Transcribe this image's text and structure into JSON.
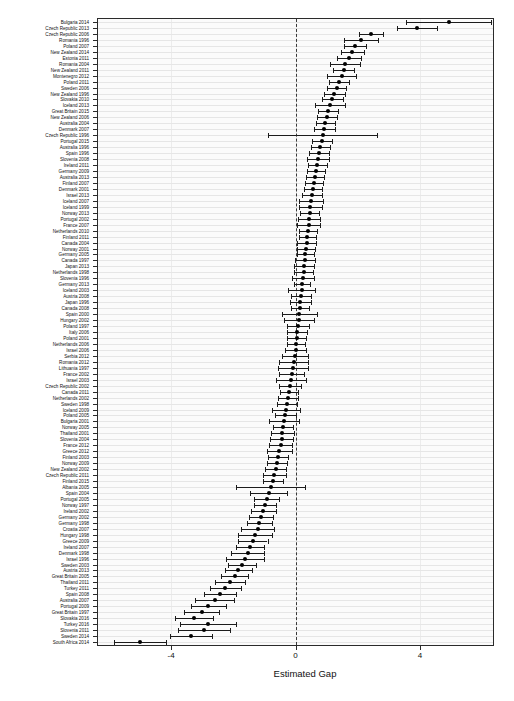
{
  "chart": {
    "type": "forest",
    "xlabel": "Estimated Gap",
    "ylabel": "",
    "title": "",
    "xlim": [
      -6.35,
      6.35
    ],
    "xticks": [
      -4,
      0,
      4
    ],
    "xticklabels": [
      "-4",
      "0",
      "4"
    ],
    "reference_line": 0,
    "reference_line_style": "dashed",
    "grid": "horizontal",
    "point_color": "#000000",
    "line_color": "#1c1c1c",
    "panel_background": "#fbfbfb",
    "grid_color": "#e6e6e6"
  },
  "chart_data": {
    "type": "scatter",
    "title": "",
    "xlabel": "Estimated Gap",
    "ylabel": "",
    "xlim": [
      -6.35,
      6.35
    ],
    "xticks": [
      -4,
      0,
      4
    ],
    "grid": true,
    "legend": null,
    "series_description": "Point estimate with 95% confidence interval per country-year, sorted descending by estimated gap",
    "columns": [
      "label",
      "estimate",
      "ci_low",
      "ci_high"
    ],
    "points": [
      [
        "Bulgaria 2014",
        4.95,
        3.55,
        6.3
      ],
      [
        "Czech Republic 2013",
        3.9,
        3.25,
        4.55
      ],
      [
        "Czech Republic 2006",
        2.42,
        2.05,
        2.8
      ],
      [
        "Romania 1996",
        2.1,
        1.55,
        2.65
      ],
      [
        "Poland 2007",
        1.9,
        1.55,
        2.26
      ],
      [
        "New Zealand 2014",
        1.82,
        1.45,
        2.2
      ],
      [
        "Estonia 2011",
        1.72,
        1.33,
        2.12
      ],
      [
        "Romania 2004",
        1.6,
        1.12,
        2.08
      ],
      [
        "New Zealand 2011",
        1.55,
        1.22,
        1.88
      ],
      [
        "Montenegro 2012",
        1.48,
        1.02,
        1.95
      ],
      [
        "Poland 2011",
        1.4,
        1.08,
        1.72
      ],
      [
        "Sweden 2006",
        1.32,
        1.02,
        1.62
      ],
      [
        "New Zealand 1996",
        1.25,
        0.92,
        1.58
      ],
      [
        "Slovakia 2010",
        1.18,
        0.85,
        1.52
      ],
      [
        "Iceland 2013",
        1.1,
        0.62,
        1.58
      ],
      [
        "Great Britain 2015",
        1.05,
        0.72,
        1.38
      ],
      [
        "New Zealand 2006",
        1.0,
        0.68,
        1.32
      ],
      [
        "Australia 2004",
        0.96,
        0.66,
        1.26
      ],
      [
        "Denmark 2007",
        0.92,
        0.58,
        1.26
      ],
      [
        "Czech Republic 1996",
        0.88,
        -0.88,
        2.62
      ],
      [
        "Portugal 2015",
        0.84,
        0.52,
        1.16
      ],
      [
        "Australia 1996",
        0.8,
        0.5,
        1.1
      ],
      [
        "Spain 1996",
        0.76,
        0.44,
        1.08
      ],
      [
        "Slovenia 2008",
        0.72,
        0.36,
        1.08
      ],
      [
        "Ireland 2011",
        0.7,
        0.4,
        1.0
      ],
      [
        "Germany 2009",
        0.66,
        0.38,
        0.94
      ],
      [
        "Australia 2013",
        0.63,
        0.35,
        0.91
      ],
      [
        "Finland 2007",
        0.6,
        0.32,
        0.88
      ],
      [
        "Denmark 2001",
        0.57,
        0.28,
        0.86
      ],
      [
        "Israel 2013",
        0.54,
        0.22,
        0.86
      ],
      [
        "Iceland 2007",
        0.51,
        0.12,
        0.9
      ],
      [
        "Iceland 1999",
        0.48,
        0.1,
        0.86
      ],
      [
        "Norway 2013",
        0.46,
        0.16,
        0.76
      ],
      [
        "Portugal 2002",
        0.44,
        0.08,
        0.8
      ],
      [
        "France 2007",
        0.42,
        0.05,
        0.79
      ],
      [
        "Netherlands 2010",
        0.4,
        0.1,
        0.7
      ],
      [
        "Finland 2011",
        0.38,
        0.1,
        0.66
      ],
      [
        "Canada 2004",
        0.36,
        0.06,
        0.66
      ],
      [
        "Norway 2001",
        0.34,
        0.04,
        0.64
      ],
      [
        "Germany 2005",
        0.32,
        0.04,
        0.6
      ],
      [
        "Canada 1997",
        0.3,
        -0.02,
        0.62
      ],
      [
        "Japan 2013",
        0.28,
        -0.04,
        0.6
      ],
      [
        "Netherlands 1998",
        0.26,
        -0.04,
        0.56
      ],
      [
        "Slovenia 1996",
        0.24,
        -0.12,
        0.6
      ],
      [
        "Germany 2013",
        0.22,
        -0.04,
        0.48
      ],
      [
        "Iceland 2003",
        0.2,
        -0.24,
        0.64
      ],
      [
        "Austria 2008",
        0.18,
        -0.14,
        0.5
      ],
      [
        "Japan 1996",
        0.16,
        -0.18,
        0.5
      ],
      [
        "Canada 2008",
        0.14,
        -0.16,
        0.44
      ],
      [
        "Spain 2000",
        0.12,
        -0.44,
        0.68
      ],
      [
        "Hungary 2002",
        0.1,
        -0.38,
        0.58
      ],
      [
        "Poland 1997",
        0.08,
        -0.26,
        0.42
      ],
      [
        "Italy 2006",
        0.06,
        -0.26,
        0.38
      ],
      [
        "Poland 2001",
        0.04,
        -0.26,
        0.34
      ],
      [
        "Netherlands 2006",
        0.02,
        -0.26,
        0.3
      ],
      [
        "Israel 2006",
        0.0,
        -0.34,
        0.34
      ],
      [
        "Serbia 2012",
        -0.03,
        -0.45,
        0.39
      ],
      [
        "Romania 2012",
        -0.06,
        -0.52,
        0.4
      ],
      [
        "Lithuania 1997",
        -0.09,
        -0.57,
        0.39
      ],
      [
        "France 2002",
        -0.12,
        -0.52,
        0.28
      ],
      [
        "Israel 2003",
        -0.15,
        -0.63,
        0.33
      ],
      [
        "Czech Republic 2002",
        -0.18,
        -0.54,
        0.18
      ],
      [
        "Canada 2011",
        -0.21,
        -0.51,
        0.09
      ],
      [
        "Netherlands 2002",
        -0.24,
        -0.56,
        0.08
      ],
      [
        "Sweden 1998",
        -0.27,
        -0.59,
        0.05
      ],
      [
        "Iceland 2009",
        -0.3,
        -0.74,
        0.14
      ],
      [
        "Poland 2005",
        -0.33,
        -0.67,
        0.01
      ],
      [
        "Bulgaria 2001",
        -0.36,
        -0.84,
        0.12
      ],
      [
        "Norway 2005",
        -0.39,
        -0.71,
        -0.07
      ],
      [
        "Thailand 2001",
        -0.42,
        -0.8,
        -0.04
      ],
      [
        "Slovenia 2004",
        -0.45,
        -0.83,
        -0.07
      ],
      [
        "France 2012",
        -0.48,
        -0.84,
        -0.12
      ],
      [
        "Greece 2012",
        -0.52,
        -0.92,
        -0.12
      ],
      [
        "Finland 2003",
        -0.56,
        -0.88,
        -0.24
      ],
      [
        "Norway 2009",
        -0.6,
        -0.92,
        -0.28
      ],
      [
        "New Zealand 2002",
        -0.64,
        -0.98,
        -0.3
      ],
      [
        "Czech Republic 2011",
        -0.68,
        -1.04,
        -0.32
      ],
      [
        "Finland 2015",
        -0.73,
        -1.05,
        -0.41
      ],
      [
        "Albania 2005",
        -0.8,
        -1.92,
        0.32
      ],
      [
        "Spain 2004",
        -0.86,
        -1.46,
        -0.26
      ],
      [
        "Portugal 2005",
        -0.92,
        -1.32,
        -0.52
      ],
      [
        "Norway 1997",
        -0.98,
        -1.34,
        -0.62
      ],
      [
        "Ireland 2002",
        -1.04,
        -1.44,
        -0.64
      ],
      [
        "Germany 2002",
        -1.1,
        -1.48,
        -0.72
      ],
      [
        "Germany 1998",
        -1.16,
        -1.56,
        -0.76
      ],
      [
        "Croatia 2007",
        -1.22,
        -1.74,
        -0.7
      ],
      [
        "Hungary 1998",
        -1.3,
        -1.84,
        -0.76
      ],
      [
        "Greece 2009",
        -1.38,
        -1.86,
        -0.9
      ],
      [
        "Ireland 2007",
        -1.46,
        -1.92,
        -1.0
      ],
      [
        "Denmark 1998",
        -1.54,
        -2.08,
        -1.0
      ],
      [
        "Israel 1996",
        -1.62,
        -2.22,
        -1.02
      ],
      [
        "Sweden 2003",
        -1.72,
        -2.16,
        -1.28
      ],
      [
        "Austria 2013",
        -1.84,
        -2.28,
        -1.4
      ],
      [
        "Great Britain 2005",
        -1.96,
        -2.4,
        -1.52
      ],
      [
        "Thailand 2011",
        -2.1,
        -2.58,
        -1.62
      ],
      [
        "Turkey 2011",
        -2.26,
        -2.76,
        -1.76
      ],
      [
        "Spain 2008",
        -2.42,
        -2.94,
        -1.9
      ],
      [
        "Australia 2007",
        -2.6,
        -3.22,
        -1.98
      ],
      [
        "Portugal 2009",
        -2.8,
        -3.36,
        -2.24
      ],
      [
        "Great Britain 1997",
        -3.02,
        -3.58,
        -2.46
      ],
      [
        "Slovakia 2016",
        -3.26,
        -3.86,
        -2.66
      ],
      [
        "Turkey 2016",
        -2.82,
        -3.72,
        -1.92
      ],
      [
        "Slovenia 2011",
        -2.95,
        -3.78,
        -2.12
      ],
      [
        "Sweden 2014",
        -3.35,
        -4.02,
        -2.68
      ],
      [
        "South Africa 2014",
        -5.0,
        -5.85,
        -4.15
      ]
    ]
  }
}
